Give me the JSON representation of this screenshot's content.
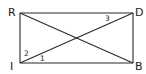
{
  "diagram": {
    "type": "rectangle-with-diagonals",
    "stroke_color": "#2a2a2a",
    "background": "#ffffff",
    "vertices": {
      "R": {
        "label": "R",
        "x": 20,
        "y": 13
      },
      "D": {
        "label": "D",
        "x": 133,
        "y": 13
      },
      "B": {
        "label": "B",
        "x": 133,
        "y": 63
      },
      "I": {
        "label": "I",
        "x": 20,
        "y": 63
      }
    },
    "segments": [
      "RD",
      "DB",
      "BI",
      "IR",
      "RB",
      "ID"
    ],
    "angle_labels": [
      {
        "label": "1",
        "at": "I",
        "between": "IB and ID"
      },
      {
        "label": "2",
        "at": "I",
        "between": "IR and ID"
      },
      {
        "label": "3",
        "at": "D",
        "between": "DR and DI"
      }
    ]
  }
}
